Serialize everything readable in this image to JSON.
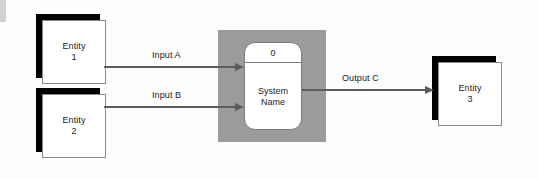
{
  "diagram": {
    "background_color": "#fdfdfd",
    "boundary_color": "#9b9b9b",
    "shadow_color": "#000000",
    "line_color": "#5c5c5c",
    "text_color": "#1b1b1b"
  },
  "entities": [
    {
      "id": "entity-1",
      "line1": "Entity",
      "line2": "1"
    },
    {
      "id": "entity-2",
      "line1": "Entity",
      "line2": "2"
    },
    {
      "id": "entity-3",
      "line1": "Entity",
      "line2": "3"
    }
  ],
  "process": {
    "number": "0",
    "name_line1": "System",
    "name_line2": "Name"
  },
  "flows": [
    {
      "id": "flow-input-a",
      "label": "Input A",
      "from": "entity-1",
      "to": "process"
    },
    {
      "id": "flow-input-b",
      "label": "Input B",
      "from": "entity-2",
      "to": "process"
    },
    {
      "id": "flow-output-c",
      "label": "Output C",
      "from": "process",
      "to": "entity-3"
    }
  ]
}
